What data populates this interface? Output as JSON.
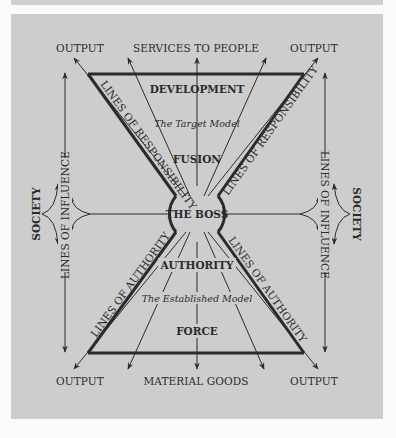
{
  "diagram": {
    "top_labels": [
      "OUTPUT",
      "SERVICES TO PEOPLE",
      "OUTPUT"
    ],
    "bottom_labels": [
      "OUTPUT",
      "MATERIAL GOODS",
      "OUTPUT"
    ],
    "upper_region": {
      "title": "DEVELOPMENT",
      "model": "The Target Model",
      "subtitle": "FUSION"
    },
    "center": "THE BOSS",
    "lower_region": {
      "title": "AUTHORITY",
      "model": "The Established Model",
      "subtitle": "FORCE"
    },
    "upper_diagonal_label": "LINES OF RESPONSIBILITY",
    "lower_diagonal_label": "LINES OF AUTHORITY",
    "side_vertical_label": "LINES OF INFLUENCE",
    "side_group_label": "SOCIETY",
    "colors": {
      "panel": "#cdcdcd",
      "ink": "#2b2b2b",
      "page": "#fbfbfb"
    }
  }
}
